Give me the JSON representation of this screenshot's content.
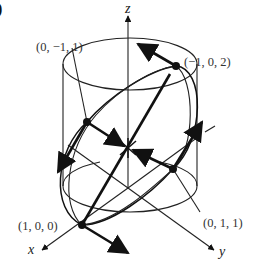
{
  "figure": {
    "panel_marker": ")",
    "axes": {
      "x_label": "x",
      "y_label": "y",
      "z_label": "z"
    },
    "points": [
      {
        "label": "(0, −1, 1)",
        "coords": [
          0,
          -1,
          1
        ]
      },
      {
        "label": "(−1, 0, 2)",
        "coords": [
          -1,
          0,
          2
        ]
      },
      {
        "label": "(1, 0, 0)",
        "coords": [
          1,
          0,
          0
        ]
      },
      {
        "label": "(0, 1, 1)",
        "coords": [
          0,
          1,
          1
        ]
      }
    ],
    "colors": {
      "stroke": "#111111",
      "text": "#333333",
      "background": "#ffffff"
    }
  }
}
